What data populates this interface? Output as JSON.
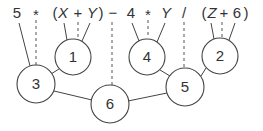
{
  "diagram": {
    "type": "expression-evaluation-tree",
    "expression_tokens": [
      {
        "id": "t0",
        "text": "5",
        "x": 17,
        "italic": false
      },
      {
        "id": "t1",
        "text": "*",
        "x": 36,
        "italic": false
      },
      {
        "id": "t2",
        "text": "(",
        "x": 54,
        "italic": false
      },
      {
        "id": "t3",
        "text": "X",
        "x": 63,
        "italic": true
      },
      {
        "id": "t4",
        "text": "+",
        "x": 78,
        "italic": false
      },
      {
        "id": "t5",
        "text": "Y",
        "x": 92,
        "italic": true
      },
      {
        "id": "t6",
        "text": ")",
        "x": 101,
        "italic": false
      },
      {
        "id": "t7",
        "text": "−",
        "x": 113,
        "italic": false
      },
      {
        "id": "t8",
        "text": "4",
        "x": 131,
        "italic": false
      },
      {
        "id": "t9",
        "text": "*",
        "x": 148,
        "italic": false
      },
      {
        "id": "t10",
        "text": "Y",
        "x": 166,
        "italic": true
      },
      {
        "id": "t11",
        "text": "/",
        "x": 183,
        "italic": false
      },
      {
        "id": "t12",
        "text": "(",
        "x": 203,
        "italic": false
      },
      {
        "id": "t13",
        "text": "Z",
        "x": 212,
        "italic": true
      },
      {
        "id": "t14",
        "text": "+",
        "x": 224,
        "italic": false
      },
      {
        "id": "t15",
        "text": "6",
        "x": 237,
        "italic": false
      },
      {
        "id": "t16",
        "text": ")",
        "x": 246,
        "italic": false
      }
    ],
    "nodes": [
      {
        "id": "n1",
        "label": "1",
        "cx": 73,
        "cy": 57,
        "r": 18
      },
      {
        "id": "n4",
        "label": "4",
        "cx": 147,
        "cy": 57,
        "r": 18
      },
      {
        "id": "n2",
        "label": "2",
        "cx": 220,
        "cy": 56,
        "r": 18
      },
      {
        "id": "n3",
        "label": "3",
        "cx": 36,
        "cy": 84,
        "r": 19
      },
      {
        "id": "n5",
        "label": "5",
        "cx": 185,
        "cy": 87,
        "r": 19
      },
      {
        "id": "n6",
        "label": "6",
        "cx": 110,
        "cy": 104,
        "r": 19
      }
    ],
    "evaluation_order_labels": [
      "1",
      "2",
      "3",
      "4",
      "5",
      "6"
    ]
  }
}
